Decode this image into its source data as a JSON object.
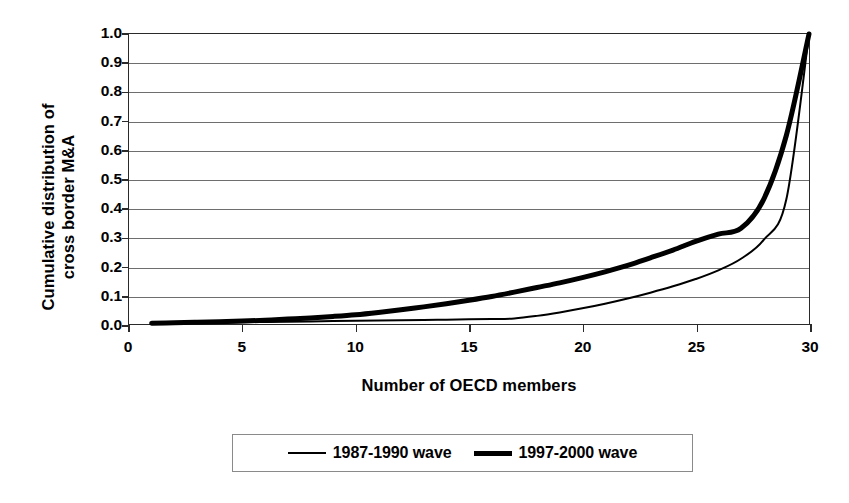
{
  "chart_data": {
    "type": "line",
    "title": "",
    "xlabel": "Number of OECD members",
    "ylabel": "Cumulative distribution of\ncross border M&A",
    "xlim": [
      0,
      30
    ],
    "ylim": [
      0,
      1.0
    ],
    "grid": true,
    "legend_position": "bottom",
    "x_ticks": [
      0,
      5,
      10,
      15,
      20,
      25,
      30
    ],
    "x_tick_labels": [
      "0",
      "5",
      "10",
      "15",
      "20",
      "25",
      "30"
    ],
    "y_ticks": [
      0.0,
      0.1,
      0.2,
      0.3,
      0.4,
      0.5,
      0.6,
      0.7,
      0.8,
      0.9,
      1.0
    ],
    "y_tick_labels": [
      "0.0",
      "0.1",
      "0.2",
      "0.3",
      "0.4",
      "0.5",
      "0.6",
      "0.7",
      "0.8",
      "0.9",
      "1.0"
    ],
    "x": [
      1,
      2,
      3,
      4,
      5,
      6,
      7,
      8,
      9,
      10,
      11,
      12,
      13,
      14,
      15,
      16,
      17,
      18,
      19,
      20,
      21,
      22,
      23,
      24,
      25,
      26,
      27,
      28,
      29,
      30
    ],
    "series": [
      {
        "name": "1987-1990 wave",
        "line_style": "thin",
        "line_width_px": 2,
        "color": "#000000",
        "values": [
          0.002,
          0.003,
          0.004,
          0.005,
          0.006,
          0.007,
          0.008,
          0.009,
          0.01,
          0.011,
          0.012,
          0.013,
          0.014,
          0.015,
          0.016,
          0.017,
          0.019,
          0.028,
          0.04,
          0.054,
          0.07,
          0.088,
          0.108,
          0.13,
          0.155,
          0.185,
          0.225,
          0.29,
          0.43,
          1.0
        ]
      },
      {
        "name": "1997-2000 wave",
        "line_style": "thick",
        "line_width_px": 5,
        "color": "#000000",
        "values": [
          0.003,
          0.004,
          0.006,
          0.008,
          0.01,
          0.013,
          0.017,
          0.021,
          0.026,
          0.032,
          0.04,
          0.049,
          0.059,
          0.07,
          0.082,
          0.095,
          0.11,
          0.126,
          0.142,
          0.16,
          0.18,
          0.202,
          0.228,
          0.255,
          0.285,
          0.31,
          0.33,
          0.43,
          0.65,
          1.0
        ]
      }
    ]
  },
  "legend": {
    "entries": [
      {
        "label": "1987-1990 wave"
      },
      {
        "label": "1997-2000 wave"
      }
    ]
  }
}
